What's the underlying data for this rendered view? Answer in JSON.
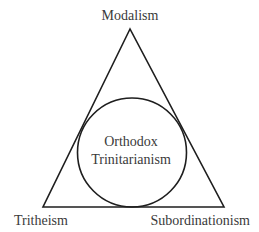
{
  "diagram": {
    "type": "triangle-with-inscribed-circle",
    "vertices": {
      "top": {
        "label": "Modalism"
      },
      "bottom_left": {
        "label": "Tritheism"
      },
      "bottom_right": {
        "label": "Subordinationism"
      }
    },
    "center": {
      "line1": "Orthodox",
      "line2": "Trinitarianism"
    },
    "colors": {
      "stroke": "#1e1e1e",
      "text": "#3a3a3a",
      "background": "#ffffff"
    }
  }
}
